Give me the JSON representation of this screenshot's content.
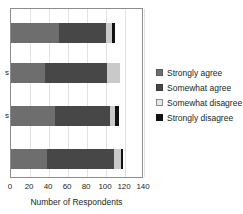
{
  "chart_data": {
    "type": "bar",
    "orientation": "horizontal",
    "stacked": true,
    "title": "",
    "xlabel": "Number of Respondents",
    "ylabel": "",
    "xlim": [
      0,
      140
    ],
    "xticks": [
      0,
      20,
      40,
      60,
      80,
      100,
      120,
      140
    ],
    "xticklabels": [
      "0",
      "20",
      "40",
      "60",
      "80",
      "100",
      "120",
      "140"
    ],
    "grid": "vertical",
    "legend_position": "right",
    "categories": [
      "",
      "s",
      "s",
      ""
    ],
    "category_labels_truncated": true,
    "series": [
      {
        "name": "Strongly agree",
        "color": "#6e6e6e",
        "values": [
          50,
          36,
          46,
          38
        ]
      },
      {
        "name": "Somewhat agree",
        "color": "#474747",
        "values": [
          50,
          65,
          58,
          70
        ]
      },
      {
        "name": "Somewhat disagree",
        "color": "#c9c9c9",
        "values": [
          6,
          14,
          6,
          8
        ]
      },
      {
        "name": "Strongly disagree",
        "color": "#121212",
        "values": [
          4,
          0,
          4,
          2
        ]
      }
    ]
  },
  "legend": {
    "items": [
      {
        "label": "Strongly agree"
      },
      {
        "label": "Somewhat agree"
      },
      {
        "label": "Somewhat disagree"
      },
      {
        "label": "Strongly disagree"
      }
    ]
  }
}
